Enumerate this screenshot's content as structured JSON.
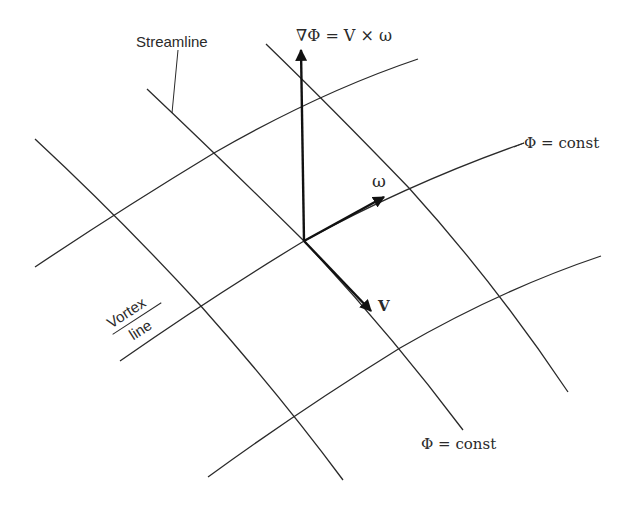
{
  "labels": {
    "gradient_eq": "∇Φ = V × ω",
    "streamline": "Streamline",
    "phi_const_upper": "Φ = const",
    "phi_const_lower": "Φ = const",
    "omega": "ω",
    "velocity": "V",
    "vortex_top": "Vortex",
    "vortex_bottom": "line"
  },
  "colors": {
    "line": "#2a2a2a",
    "vector": "#111111",
    "background": "#ffffff"
  },
  "geometry": {
    "origin": [
      304,
      241
    ],
    "vectors": {
      "grad_phi_tip": [
        301,
        48
      ],
      "omega_tip": [
        386,
        196
      ],
      "velocity_tip": [
        373,
        313
      ]
    },
    "vortex_lines": [
      [
        [
          35,
          267
        ],
        [
          113,
          213
        ],
        [
          214,
          153
        ],
        [
          320,
          98
        ],
        [
          418,
          59
        ]
      ],
      [
        [
          120,
          361
        ],
        [
          200,
          305
        ],
        [
          304,
          241
        ],
        [
          409,
          188
        ],
        [
          524,
          143
        ]
      ],
      [
        [
          208,
          477
        ],
        [
          297,
          415
        ],
        [
          400,
          348
        ],
        [
          501,
          295
        ],
        [
          601,
          256
        ]
      ]
    ],
    "streamlines": [
      [
        [
          35,
          139
        ],
        [
          113,
          213
        ],
        [
          200,
          305
        ],
        [
          297,
          415
        ],
        [
          343,
          480
        ]
      ],
      [
        [
          147,
          89
        ],
        [
          214,
          153
        ],
        [
          304,
          241
        ],
        [
          400,
          348
        ],
        [
          463,
          430
        ]
      ],
      [
        [
          266,
          44
        ],
        [
          320,
          98
        ],
        [
          409,
          188
        ],
        [
          501,
          295
        ],
        [
          568,
          392
        ]
      ]
    ]
  }
}
